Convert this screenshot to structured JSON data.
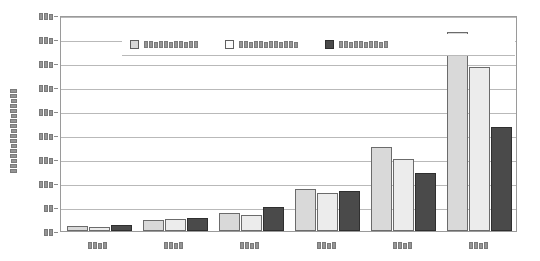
{
  "chart_data": {
    "type": "bar",
    "title": "",
    "xlabel": "",
    "ylabel": "█████████████████",
    "ylabel_redacted": true,
    "ylabel_char_count": 17,
    "grid": true,
    "legend_position": "top-left-inside",
    "ylim": [
      0,
      9
    ],
    "ytick_count": 10,
    "ytick_labels": [
      "███",
      "███",
      "███",
      "███",
      "███",
      "███",
      "███",
      "███",
      "██",
      "██"
    ],
    "ytick_char_counts": [
      3,
      3,
      3,
      3,
      3,
      3,
      3,
      3,
      2,
      2
    ],
    "categories": [
      "████",
      "████",
      "████",
      "████",
      "████",
      "████"
    ],
    "category_char_counts": [
      4,
      4,
      4,
      4,
      4,
      4
    ],
    "series": [
      {
        "name": "███████████",
        "name_char_count": 11,
        "color": "#d9d9d9",
        "values": [
          0.2,
          0.45,
          0.75,
          1.75,
          3.5,
          8.3
        ]
      },
      {
        "name": "████████████",
        "name_char_count": 12,
        "color": "#ececec",
        "values": [
          0.15,
          0.5,
          0.65,
          1.6,
          3.0,
          6.85
        ]
      },
      {
        "name": "██████████",
        "name_char_count": 10,
        "color": "#4a4a4a",
        "values": [
          0.25,
          0.55,
          1.0,
          1.65,
          2.4,
          4.35
        ]
      }
    ]
  },
  "colors": {
    "series_1": "#d9d9d9",
    "series_2": "#ececec",
    "series_3": "#4a4a4a",
    "gridline": "#b9b9b9",
    "axis": "#9a9a9a",
    "background": "#ffffff"
  }
}
